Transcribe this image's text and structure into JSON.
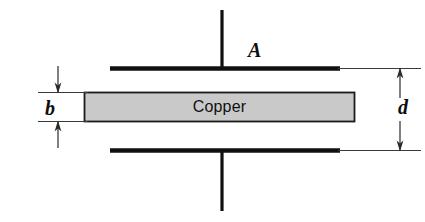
{
  "figure": {
    "kind": "physics-diagram",
    "background_color": "#ffffff",
    "width": 425,
    "height": 222
  },
  "labels": {
    "plate_area": "A",
    "slab_thickness": "b",
    "plate_separation": "d",
    "slab_material": "Copper"
  },
  "colors": {
    "ink": "#0d0d0d",
    "plate": "#111111",
    "slab_fill": "#c9c9c9",
    "slab_border": "#1a1a1a",
    "thin_line": "#3a3a3a",
    "background": "#ffffff"
  },
  "geometry": {
    "top_plate": {
      "x1": 110,
      "x2": 340,
      "y": 68,
      "thickness": 4.5
    },
    "bottom_plate": {
      "x1": 110,
      "x2": 340,
      "y": 150,
      "thickness": 4.5
    },
    "top_lead": {
      "x": 222,
      "y1": 10,
      "y2": 68
    },
    "bottom_lead": {
      "x": 222,
      "y1": 150,
      "y2": 210
    },
    "slab": {
      "x": 84,
      "y": 92,
      "width": 271,
      "height": 30
    },
    "b_dimension": {
      "ext_top_y": 92,
      "ext_bottom_y": 122,
      "ext_x1": 38,
      "ext_x2": 86,
      "arrow_x": 58
    },
    "d_dimension": {
      "ext_top_y": 68,
      "ext_bottom_y": 150,
      "ext_x1": 340,
      "ext_x2": 421,
      "arrow_x": 400
    }
  }
}
